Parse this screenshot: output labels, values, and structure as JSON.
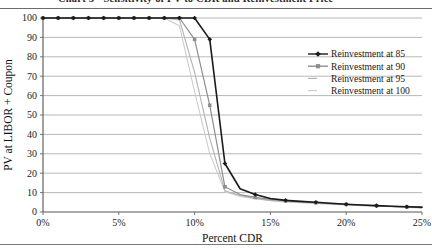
{
  "figure": {
    "title_clipped": "Chart 3 - Sensitivity of PV to CDR and Reinvestment Price",
    "has_top_rule": true,
    "has_bottom_rule": true
  },
  "chart_data": {
    "type": "line",
    "title": "",
    "xlabel": "Percent CDR",
    "ylabel": "PV at LIBOR + Coupon",
    "xlim": [
      0,
      25
    ],
    "ylim": [
      0,
      100
    ],
    "xtick_labels": [
      "0%",
      "5%",
      "10%",
      "15%",
      "20%",
      "25%"
    ],
    "xtick_values": [
      0,
      5,
      10,
      15,
      20,
      25
    ],
    "ytick_labels": [
      "0",
      "10",
      "20",
      "30",
      "40",
      "50",
      "60",
      "70",
      "80",
      "90",
      "100"
    ],
    "ytick_values": [
      0,
      10,
      20,
      30,
      40,
      50,
      60,
      70,
      80,
      90,
      100
    ],
    "grid": "horizontal",
    "legend_position": "top-right",
    "series": [
      {
        "name": "Reinvestment at 85",
        "color": "#1a1a1a",
        "marker": "diamond",
        "width": 1.6,
        "x": [
          0,
          1,
          2,
          3,
          4,
          5,
          6,
          7,
          8,
          9,
          10,
          11,
          12,
          13,
          14,
          15,
          16,
          17,
          18,
          19,
          20,
          21,
          22,
          23,
          24,
          25
        ],
        "values": [
          100,
          100,
          100,
          100,
          100,
          100,
          100,
          100,
          100,
          100,
          100,
          89,
          25,
          12,
          9,
          7,
          6,
          5.5,
          5,
          4.5,
          4,
          3.6,
          3.3,
          3,
          2.7,
          2.5
        ]
      },
      {
        "name": "Reinvestment at 90",
        "color": "#8e8e8e",
        "marker": "square",
        "width": 1.2,
        "x": [
          0,
          1,
          2,
          3,
          4,
          5,
          6,
          7,
          8,
          9,
          10,
          11,
          12,
          13,
          14,
          15,
          16,
          17,
          18,
          19,
          20,
          21,
          22,
          23,
          24,
          25
        ],
        "values": [
          100,
          100,
          100,
          100,
          100,
          100,
          100,
          100,
          100,
          100,
          89,
          55,
          13,
          9,
          7.5,
          6.5,
          5.8,
          5.2,
          4.8,
          4.3,
          3.9,
          3.6,
          3.2,
          2.9,
          2.6,
          2.3
        ]
      },
      {
        "name": "Reinvestment at 95",
        "color": "#b2b2b2",
        "marker": "none",
        "width": 1.1,
        "x": [
          0,
          1,
          2,
          3,
          4,
          5,
          6,
          7,
          8,
          9,
          10,
          11,
          12,
          13,
          14,
          15,
          16,
          17,
          18,
          19,
          20,
          21,
          22,
          23,
          24,
          25
        ],
        "values": [
          100,
          100,
          100,
          100,
          100,
          100,
          100,
          100,
          100,
          99,
          72,
          38,
          11,
          8.5,
          7,
          6,
          5.4,
          5,
          4.5,
          4.1,
          3.7,
          3.4,
          3.1,
          2.8,
          2.5,
          2.2
        ]
      },
      {
        "name": "Reinvestment at 100",
        "color": "#cdcdcd",
        "marker": "none",
        "width": 1.1,
        "x": [
          0,
          1,
          2,
          3,
          4,
          5,
          6,
          7,
          8,
          9,
          10,
          11,
          12,
          13,
          14,
          15,
          16,
          17,
          18,
          19,
          20,
          21,
          22,
          23,
          24,
          25
        ],
        "values": [
          100,
          100,
          100,
          100,
          100,
          100,
          100,
          100,
          100,
          96,
          62,
          30,
          10.5,
          8,
          6.8,
          5.8,
          5.2,
          4.8,
          4.4,
          4,
          3.6,
          3.3,
          3,
          2.7,
          2.4,
          2.1
        ]
      }
    ],
    "legend_entries": [
      {
        "label": "Reinvestment at 85",
        "color": "#1a1a1a",
        "marker": "diamond"
      },
      {
        "label": "Reinvestment at 90",
        "color": "#8e8e8e",
        "marker": "square"
      },
      {
        "label": "Reinvestment at 95",
        "color": "#b2b2b2",
        "marker": "none"
      },
      {
        "label": "Reinvestment at 100",
        "color": "#cdcdcd",
        "marker": "none"
      }
    ]
  }
}
